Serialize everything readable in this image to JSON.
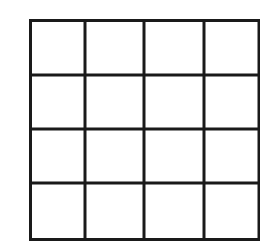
{
  "diagram": {
    "type": "grid",
    "rows": 4,
    "columns": 4,
    "line_color": "#1a1a1a",
    "background_color": "#ffffff",
    "cells": [
      [
        "",
        "",
        "",
        ""
      ],
      [
        "",
        "",
        "",
        ""
      ],
      [
        "",
        "",
        "",
        ""
      ],
      [
        "",
        "",
        "",
        ""
      ]
    ]
  }
}
